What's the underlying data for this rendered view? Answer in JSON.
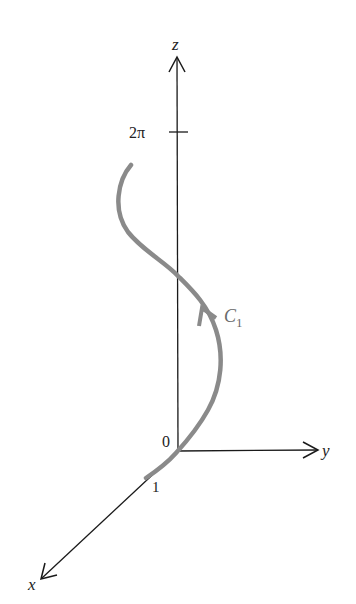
{
  "diagram": {
    "axes": {
      "z": {
        "label": "z"
      },
      "y": {
        "label": "y"
      },
      "x": {
        "label": "x"
      },
      "origin_label": "0",
      "x_tick_label": "1",
      "z_tick_label": "2π"
    },
    "curve": {
      "name": "C",
      "subscript": "1",
      "color": "#8a8a8a",
      "description": "helix-like curve from (1,0,0) through origin region rising to z = 2π"
    },
    "colors": {
      "axis": "#1a1a1a",
      "curve": "#8a8a8a",
      "background": "#ffffff"
    }
  }
}
